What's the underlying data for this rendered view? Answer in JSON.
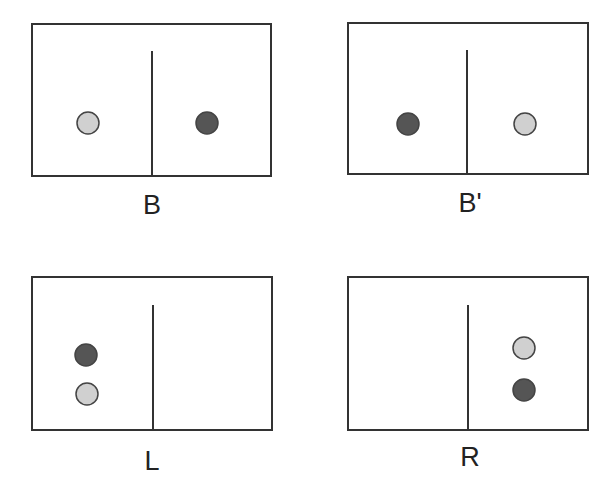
{
  "colors": {
    "stroke": "#333333",
    "light_circle": "#d0d0d0",
    "dark_circle": "#555555",
    "circle_stroke": "#444444"
  },
  "panels": [
    {
      "id": "B",
      "label": "B",
      "box": {
        "x": 32,
        "y": 24,
        "w": 239,
        "h": 152
      },
      "divider": {
        "x": 152,
        "y1": 51
      },
      "label_pos": {
        "x": 152,
        "y": 192
      },
      "circles": [
        {
          "shade": "light",
          "cx": 88,
          "cy": 123
        },
        {
          "shade": "dark",
          "cx": 207,
          "cy": 123
        }
      ]
    },
    {
      "id": "B-prime",
      "label": "B'",
      "box": {
        "x": 348,
        "y": 23,
        "w": 240,
        "h": 151
      },
      "divider": {
        "x": 467,
        "y1": 50
      },
      "label_pos": {
        "x": 470,
        "y": 190
      },
      "circles": [
        {
          "shade": "dark",
          "cx": 408,
          "cy": 124
        },
        {
          "shade": "light",
          "cx": 525,
          "cy": 124
        }
      ]
    },
    {
      "id": "L",
      "label": "L",
      "box": {
        "x": 32,
        "y": 277,
        "w": 240,
        "h": 153
      },
      "divider": {
        "x": 153,
        "y1": 305
      },
      "label_pos": {
        "x": 152,
        "y": 448
      },
      "circles": [
        {
          "shade": "dark",
          "cx": 86,
          "cy": 355
        },
        {
          "shade": "light",
          "cx": 87,
          "cy": 394
        }
      ]
    },
    {
      "id": "R",
      "label": "R",
      "box": {
        "x": 348,
        "y": 277,
        "w": 240,
        "h": 153
      },
      "divider": {
        "x": 468,
        "y1": 305
      },
      "label_pos": {
        "x": 470,
        "y": 444
      },
      "circles": [
        {
          "shade": "light",
          "cx": 524,
          "cy": 348
        },
        {
          "shade": "dark",
          "cx": 524,
          "cy": 390
        }
      ]
    }
  ],
  "circle_radius": 11
}
